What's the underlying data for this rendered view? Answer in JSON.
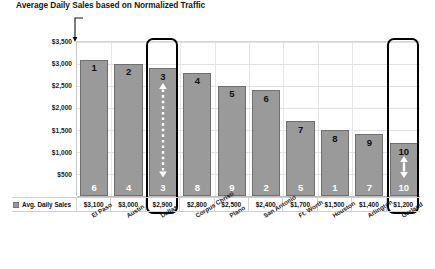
{
  "chart_data": {
    "type": "bar",
    "title": "Average Daily Sales based on Normalized Traffic",
    "xlabel": "",
    "ylabel": "",
    "ylim": [
      0,
      3500
    ],
    "grid": true,
    "legend_position": "bottom-left",
    "legend": [
      "Avg. Daily Sales"
    ],
    "categories": [
      "El Paso",
      "Austin",
      "Dallas",
      "Corpus Christi",
      "Plano",
      "San Antonio",
      "Ft. Worth",
      "Houston",
      "Arlington",
      "Garland"
    ],
    "values": [
      3100,
      3000,
      2900,
      2800,
      2500,
      2400,
      1700,
      1500,
      1400,
      1200
    ],
    "value_labels": [
      "$3,100",
      "$3,000",
      "$2,900",
      "$2,800",
      "$2,500",
      "$2,400",
      "$1,700",
      "$1,500",
      "$1,400",
      "$1,200"
    ],
    "series": [
      {
        "name": "Avg. Daily Sales",
        "values": [
          3100,
          3000,
          2900,
          2800,
          2500,
          2400,
          1700,
          1500,
          1400,
          1200
        ]
      }
    ],
    "rank_above_bar": [
      "1",
      "2",
      "3",
      "4",
      "5",
      "6",
      "7",
      "8",
      "9",
      "10"
    ],
    "rank_inside_bar": [
      "6",
      "4",
      "3",
      "8",
      "9",
      "2",
      "5",
      "1",
      "7",
      "10"
    ],
    "yticks": [
      "$3,500",
      "$3,000",
      "$2,500",
      "$2,000",
      "$1,500",
      "$1,000",
      "$500"
    ],
    "ytick_values": [
      3500,
      3000,
      2500,
      2000,
      1500,
      1000,
      500
    ],
    "highlighted_categories": [
      "Dallas",
      "Garland"
    ],
    "annotations": [
      {
        "category": "Dallas",
        "marker": "dashed-double-arrow",
        "color": "#ffffff"
      },
      {
        "category": "Garland",
        "marker": "double-arrow",
        "color": "#ffffff"
      }
    ],
    "colors": {
      "bar_fill": "#9a9a9a",
      "bar_border": "#6f6f6f",
      "highlight_box": "#000000",
      "grid": "#e2e2e2",
      "text": "#1a1a1a",
      "background": "#ffffff"
    }
  },
  "legend": {
    "row_label": "Avg. Daily Sales",
    "swatch_name": "avg-daily-sales-swatch"
  },
  "icons": {
    "title_leader": "leader-line-icon",
    "up_arrow": "arrow-up-icon",
    "down_arrow": "arrow-down-icon"
  }
}
